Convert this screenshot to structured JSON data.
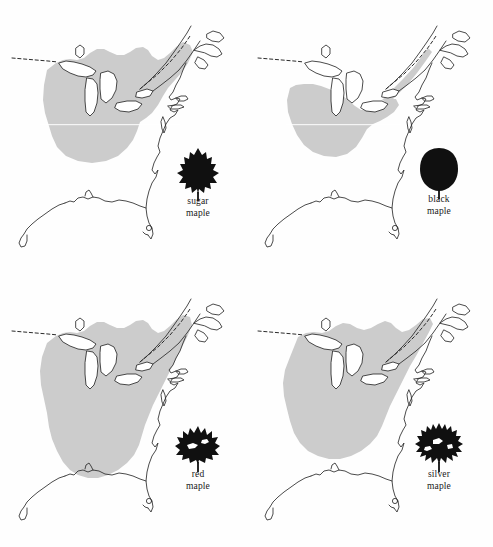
{
  "figure": {
    "type": "map-grid",
    "width": 493,
    "height": 547,
    "background_color": "#ffffff",
    "columns": 2,
    "rows": 2,
    "region_depicted": "Eastern North America",
    "range_fill_color": "#cccccc",
    "coastline_color": "#2b2b2b",
    "border_line_style": "dashed",
    "leaf_silhouette_color": "#101010"
  },
  "panels": [
    {
      "id": "sugar-maple",
      "position": "top-left",
      "caption_line1": "sugar",
      "caption_line2": "maple",
      "leaf_icon": "sugar-maple-leaf-icon",
      "range_description": "Northeastern United States, Great Lakes states, Appalachians and southeastern Canada",
      "range_extent": "moderate"
    },
    {
      "id": "black-maple",
      "position": "top-right",
      "caption_line1": "black",
      "caption_line2": "maple",
      "leaf_icon": "black-maple-leaf-icon",
      "range_description": "Ohio Valley and central Midwest, narrow band along the lower Great Lakes",
      "range_extent": "smallest"
    },
    {
      "id": "red-maple",
      "position": "bottom-left",
      "caption_line1": "red",
      "caption_line2": "maple",
      "leaf_icon": "red-maple-leaf-icon",
      "range_description": "Entire eastern United States from Florida to the Canadian Maritimes",
      "range_extent": "largest"
    },
    {
      "id": "silver-maple",
      "position": "bottom-right",
      "caption_line1": "silver",
      "caption_line2": "maple",
      "leaf_icon": "silver-maple-leaf-icon",
      "range_description": "Central and eastern United States excluding Florida and the Gulf coastal plain",
      "range_extent": "large"
    }
  ]
}
